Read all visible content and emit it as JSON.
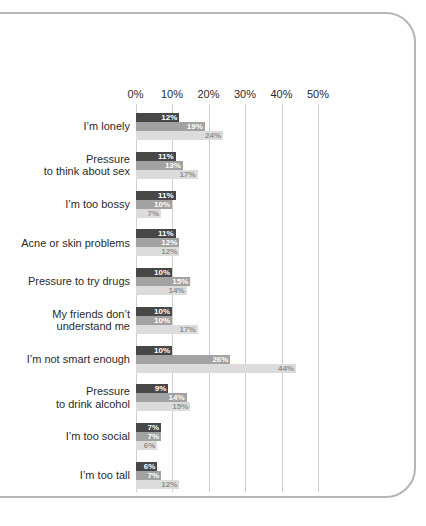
{
  "panel": {
    "background": "#ffffff",
    "border_color": "#b5b5b5"
  },
  "chart_data": {
    "type": "bar",
    "orientation": "horizontal",
    "title": "",
    "xlabel": "",
    "ylabel": "",
    "grid": true,
    "legend": "none",
    "axis": {
      "tick_labels": [
        "0%",
        "10%",
        "20%",
        "30%",
        "40%",
        "50%"
      ],
      "tick_values": [
        0,
        10,
        20,
        30,
        40,
        50
      ],
      "max": 50
    },
    "value_suffix": "%",
    "categories": [
      "I’m lonely",
      "Pressure\nto think about sex",
      "I’m too bossy",
      "Acne or skin problems",
      "Pressure to try drugs",
      "My friends don’t\nunderstand me",
      "I’m not smart enough",
      "Pressure\nto drink alcohol",
      "I’m too social",
      "I’m too tall"
    ],
    "series": [
      {
        "name": "series-dark",
        "color": "#474747",
        "label_color": "#ffffff",
        "values": [
          12,
          11,
          11,
          11,
          10,
          10,
          10,
          9,
          7,
          6
        ]
      },
      {
        "name": "series-medium",
        "color": "#a2a2a2",
        "label_color": "#ffffff",
        "values": [
          19,
          13,
          10,
          12,
          15,
          10,
          26,
          14,
          7,
          7
        ]
      },
      {
        "name": "series-light",
        "color": "#dcdcdc",
        "label_color": "#8f8f8f",
        "values": [
          24,
          17,
          7,
          12,
          14,
          17,
          44,
          15,
          6,
          12
        ]
      }
    ]
  }
}
